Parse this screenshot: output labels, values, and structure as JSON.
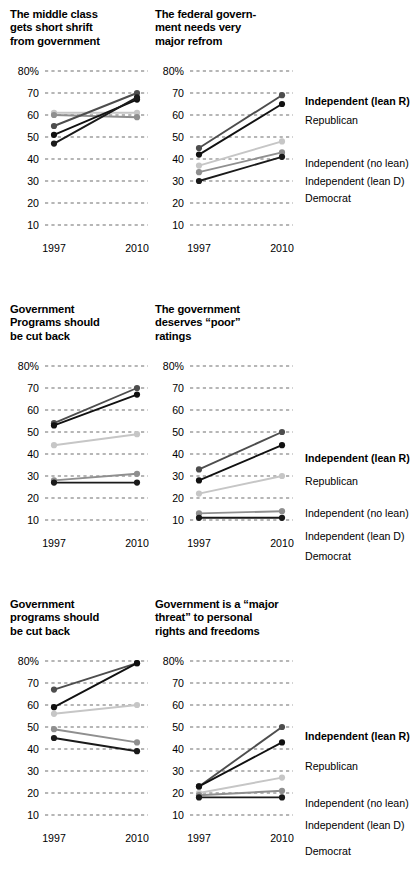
{
  "figure": {
    "x_ticks": [
      "1997",
      "2010"
    ],
    "y_ticks": [
      "80%",
      "70",
      "60",
      "50",
      "40",
      "30",
      "20",
      "10"
    ],
    "y_min": 5,
    "y_max": 85,
    "series_names": [
      "Independent (lean R)",
      "Republican",
      "Independent (no lean)",
      "Independent (lean D)",
      "Democrat"
    ],
    "series_colors": [
      "#4d4d4d",
      "#111111",
      "#c6c6c6",
      "#8f8f8f",
      "#1a1a1a"
    ]
  },
  "legend": {
    "items": [
      {
        "label": "Independent (lean R)",
        "bold": true
      },
      {
        "label": "Republican",
        "bold": false
      },
      {
        "label": "Independent (no lean)",
        "bold": false
      },
      {
        "label": "Independent (lean D)",
        "bold": false
      },
      {
        "label": "Democrat",
        "bold": false
      }
    ]
  },
  "chart_data": [
    {
      "type": "line",
      "title": "The middle class\ngets short shrift\nfrom government",
      "x": [
        "1997",
        "2010"
      ],
      "xlabel": "",
      "ylabel": "",
      "ylim": [
        5,
        85
      ],
      "grid": true,
      "series": [
        {
          "name": "Independent (lean R)",
          "values": [
            55,
            70
          ]
        },
        {
          "name": "Republican",
          "values": [
            51,
            67
          ]
        },
        {
          "name": "Independent (no lean)",
          "values": [
            61,
            61
          ]
        },
        {
          "name": "Independent (lean D)",
          "values": [
            60,
            59
          ]
        },
        {
          "name": "Democrat",
          "values": [
            47,
            68
          ]
        }
      ]
    },
    {
      "type": "line",
      "title": "The federal govern-\nment needs very\nmajor refrom",
      "x": [
        "1997",
        "2010"
      ],
      "xlabel": "",
      "ylabel": "",
      "ylim": [
        5,
        85
      ],
      "grid": true,
      "series": [
        {
          "name": "Independent (lean R)",
          "values": [
            45,
            69
          ]
        },
        {
          "name": "Republican",
          "values": [
            42,
            65
          ]
        },
        {
          "name": "Independent (no lean)",
          "values": [
            37,
            48
          ]
        },
        {
          "name": "Independent (lean D)",
          "values": [
            34,
            43
          ]
        },
        {
          "name": "Democrat",
          "values": [
            30,
            41
          ]
        }
      ]
    },
    {
      "type": "line",
      "title": "Government\nPrograms should\nbe cut back",
      "x": [
        "1997",
        "2010"
      ],
      "xlabel": "",
      "ylabel": "",
      "ylim": [
        5,
        85
      ],
      "grid": true,
      "series": [
        {
          "name": "Independent (lean R)",
          "values": [
            54,
            70
          ]
        },
        {
          "name": "Republican",
          "values": [
            53,
            67
          ]
        },
        {
          "name": "Independent (no lean)",
          "values": [
            44,
            49
          ]
        },
        {
          "name": "Independent (lean D)",
          "values": [
            28,
            31
          ]
        },
        {
          "name": "Democrat",
          "values": [
            27,
            27
          ]
        }
      ]
    },
    {
      "type": "line",
      "title": "The government\ndeserves “poor”\nratings",
      "x": [
        "1997",
        "2010"
      ],
      "xlabel": "",
      "ylabel": "",
      "ylim": [
        5,
        85
      ],
      "grid": true,
      "series": [
        {
          "name": "Independent (lean R)",
          "values": [
            33,
            50
          ]
        },
        {
          "name": "Republican",
          "values": [
            28,
            44
          ]
        },
        {
          "name": "Independent (no lean)",
          "values": [
            22,
            30
          ]
        },
        {
          "name": "Independent (lean D)",
          "values": [
            13,
            14
          ]
        },
        {
          "name": "Democrat",
          "values": [
            11,
            11
          ]
        }
      ]
    },
    {
      "type": "line",
      "title": "Government\nprograms should\nbe cut back",
      "x": [
        "1997",
        "2010"
      ],
      "xlabel": "",
      "ylabel": "",
      "ylim": [
        5,
        85
      ],
      "grid": true,
      "series": [
        {
          "name": "Independent (lean R)",
          "values": [
            67,
            79
          ]
        },
        {
          "name": "Republican",
          "values": [
            59,
            79
          ]
        },
        {
          "name": "Independent (no lean)",
          "values": [
            56,
            60
          ]
        },
        {
          "name": "Independent (lean D)",
          "values": [
            49,
            43
          ]
        },
        {
          "name": "Democrat",
          "values": [
            45,
            39
          ]
        }
      ]
    },
    {
      "type": "line",
      "title": "Government is a “major\nthreat” to personal\nrights and freedoms",
      "x": [
        "1997",
        "2010"
      ],
      "xlabel": "",
      "ylabel": "",
      "ylim": [
        5,
        85
      ],
      "grid": true,
      "series": [
        {
          "name": "Independent (lean R)",
          "values": [
            23,
            50
          ]
        },
        {
          "name": "Republican",
          "values": [
            23,
            43
          ]
        },
        {
          "name": "Independent (no lean)",
          "values": [
            20,
            27
          ]
        },
        {
          "name": "Independent (lean D)",
          "values": [
            19,
            21
          ]
        },
        {
          "name": "Democrat",
          "values": [
            18,
            18
          ]
        }
      ]
    }
  ]
}
